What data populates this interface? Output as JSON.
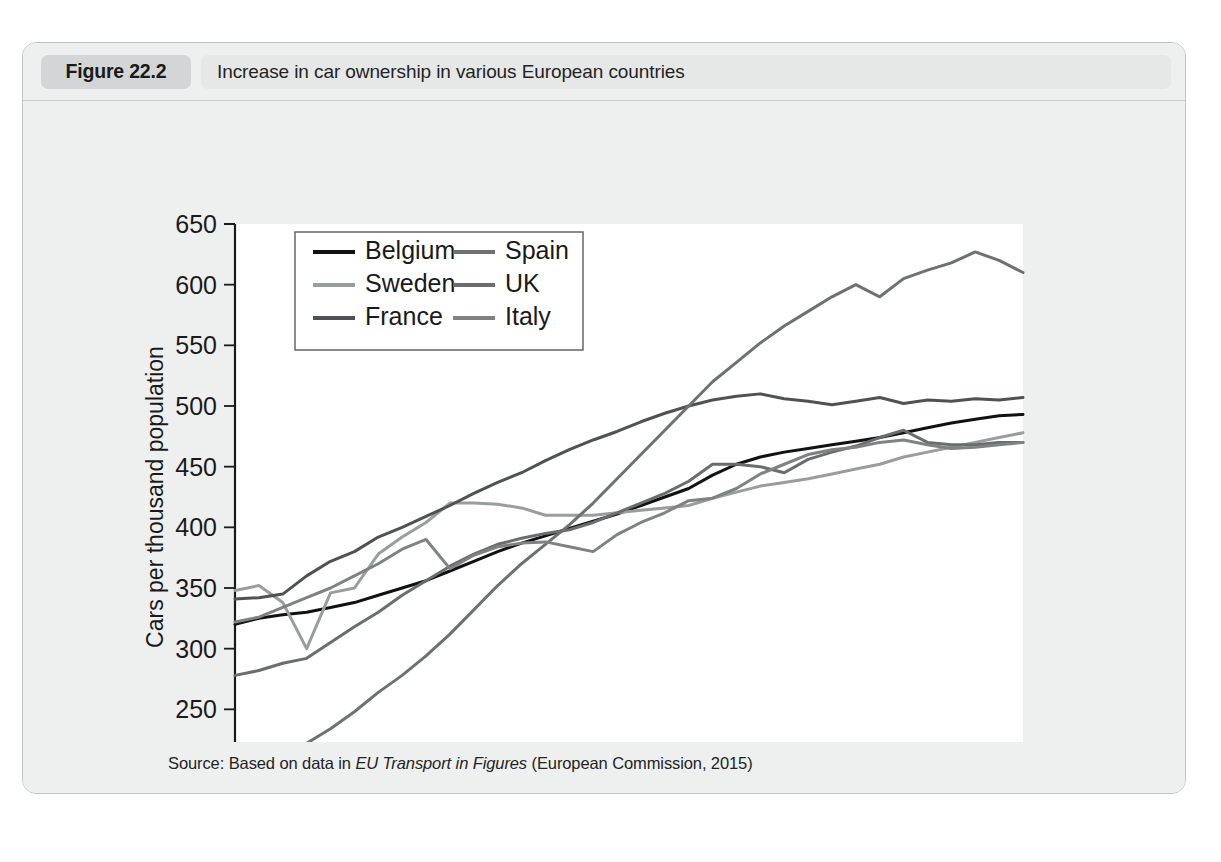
{
  "figure": {
    "badge": "Figure 22.2",
    "caption": "Increase in car ownership in various European countries",
    "source_prefix": "Source: Based on data in ",
    "source_italic": "EU Transport in Figures",
    "source_suffix": " (European Commission, 2015)"
  },
  "chart_data": {
    "type": "line",
    "title": "Increase in car ownership in various European countries",
    "xlabel": "",
    "ylabel": "Cars per thousand population",
    "xlim": [
      1980,
      2013
    ],
    "ylim": [
      200,
      650
    ],
    "yticks": [
      200,
      250,
      300,
      350,
      400,
      450,
      500,
      550,
      600,
      650
    ],
    "xticks_labeled": [
      1980,
      1985,
      1990,
      1995,
      2000,
      2005,
      2010
    ],
    "xtick_step_minor": 1,
    "grid": false,
    "legend_position": "top-left-inside",
    "legend_columns": 2,
    "x": [
      1980,
      1981,
      1982,
      1983,
      1984,
      1985,
      1986,
      1987,
      1988,
      1989,
      1990,
      1991,
      1992,
      1993,
      1994,
      1995,
      1996,
      1997,
      1998,
      1999,
      2000,
      2001,
      2002,
      2003,
      2004,
      2005,
      2006,
      2007,
      2008,
      2009,
      2010,
      2011,
      2012,
      2013
    ],
    "series": [
      {
        "name": "Belgium",
        "color": "#111111",
        "values": [
          320,
          325,
          328,
          330,
          334,
          338,
          344,
          350,
          356,
          364,
          372,
          380,
          387,
          393,
          399,
          405,
          411,
          418,
          425,
          432,
          443,
          452,
          458,
          462,
          465,
          468,
          471,
          474,
          478,
          482,
          486,
          489,
          492,
          493
        ]
      },
      {
        "name": "Sweden",
        "color": "#9a9d9d",
        "values": [
          348,
          352,
          338,
          300,
          346,
          350,
          378,
          392,
          404,
          420,
          420,
          419,
          416,
          410,
          410,
          410,
          412,
          414,
          416,
          418,
          424,
          429,
          434,
          437,
          440,
          444,
          448,
          452,
          458,
          462,
          466,
          470,
          474,
          478
        ]
      },
      {
        "name": "France",
        "color": "#4f5252",
        "values": [
          341,
          342,
          345,
          360,
          372,
          380,
          392,
          400,
          409,
          418,
          428,
          437,
          445,
          455,
          464,
          472,
          479,
          487,
          494,
          500,
          505,
          508,
          510,
          506,
          504,
          501,
          504,
          507,
          502,
          505,
          504,
          506,
          505,
          507
        ]
      },
      {
        "name": "Spain",
        "color": "#6e7171",
        "values": [
          210,
          218,
          200,
          222,
          234,
          248,
          264,
          278,
          294,
          312,
          332,
          352,
          370,
          386,
          402,
          420,
          440,
          460,
          480,
          500,
          520,
          536,
          552,
          566,
          578,
          590,
          600,
          590,
          605,
          612,
          618,
          627,
          620,
          610
        ]
      },
      {
        "name": "UK",
        "color": "#6a6d6d",
        "values": [
          278,
          282,
          288,
          292,
          305,
          318,
          330,
          344,
          356,
          368,
          378,
          386,
          391,
          395,
          398,
          404,
          412,
          420,
          428,
          438,
          452,
          452,
          450,
          445,
          456,
          462,
          467,
          474,
          480,
          470,
          468,
          468,
          470,
          470
        ]
      },
      {
        "name": "Italy",
        "color": "#7f8282",
        "values": [
          322,
          326,
          334,
          342,
          350,
          360,
          370,
          382,
          390,
          366,
          377,
          384,
          387,
          388,
          384,
          380,
          394,
          404,
          412,
          422,
          424,
          432,
          444,
          452,
          460,
          464,
          466,
          470,
          472,
          468,
          465,
          466,
          468,
          470
        ]
      }
    ]
  }
}
